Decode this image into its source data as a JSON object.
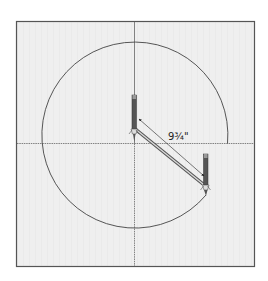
{
  "diagram": {
    "measurement_label": "9¾\"",
    "colors": {
      "background": "#ffffff",
      "panel": "#efefef",
      "grid": "#e4e4e4",
      "border": "#555555",
      "axis": "#666666",
      "arc": "#444444",
      "pencil": "#555555",
      "arrow": "#222222"
    },
    "elements": [
      {
        "name": "drawing-panel",
        "type": "panel"
      },
      {
        "name": "horizontal-axis",
        "type": "axis-line"
      },
      {
        "name": "vertical-axis",
        "type": "axis-line"
      },
      {
        "name": "circle-arc",
        "type": "arc",
        "description": "partially drawn circle"
      },
      {
        "name": "compass-needle-leg",
        "type": "compass-leg",
        "position": "center"
      },
      {
        "name": "compass-pencil-leg",
        "type": "compass-leg",
        "position": "lower-right on arc"
      },
      {
        "name": "compass-arm",
        "type": "connector"
      },
      {
        "name": "radius-dimension-arrow",
        "type": "dimension"
      }
    ]
  }
}
